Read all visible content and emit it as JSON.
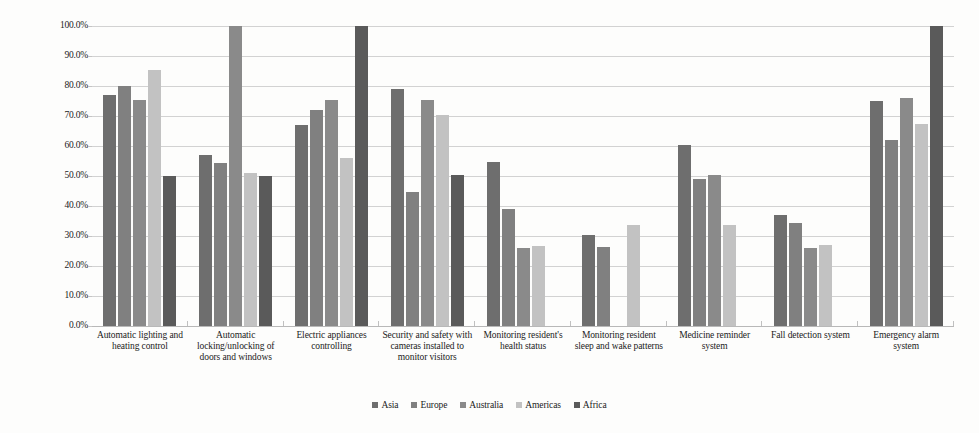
{
  "chart_data": {
    "type": "bar",
    "title": "",
    "subtitle": "",
    "xlabel": "",
    "ylabel": "",
    "ylim": [
      0,
      1.0
    ],
    "grid": true,
    "legend_position": "bottom",
    "y_tick_labels": [
      "100.0%",
      "90.0%",
      "80.0%",
      "70.0%",
      "60.0%",
      "50.0%",
      "40.0%",
      "30.0%",
      "20.0%",
      "10.0%",
      "0.0%"
    ],
    "y_tick_values": [
      1.0,
      0.9,
      0.8,
      0.7,
      0.6,
      0.5,
      0.4,
      0.3,
      0.2,
      0.1,
      0.0
    ],
    "value_format": "percent",
    "categories": [
      "Automatic lighting and heating control",
      "Automatic locking/unlocking of doors and windows",
      "Electric appliances controlling",
      "Security and safety with cameras installed to monitor visitors",
      "Monitoring resident's health status",
      "Monitoring resident sleep and wake patterns",
      "Medicine reminder system",
      "Fall detection system",
      "Emergency alarm system"
    ],
    "series": [
      {
        "name": "Asia",
        "color": "#6e6e6e",
        "values": [
          0.77,
          0.57,
          0.67,
          0.79,
          0.548,
          0.305,
          0.605,
          0.37,
          0.75
        ]
      },
      {
        "name": "Europe",
        "color": "#808080",
        "values": [
          0.8,
          0.542,
          0.72,
          0.448,
          0.39,
          0.262,
          0.49,
          0.345,
          0.62
        ]
      },
      {
        "name": "Australia",
        "color": "#8a8a8a",
        "values": [
          0.752,
          1.0,
          0.755,
          0.755,
          0.26,
          null,
          0.505,
          0.26,
          0.76
        ]
      },
      {
        "name": "Americas",
        "color": "#c2c2c2",
        "values": [
          0.852,
          0.51,
          0.56,
          0.705,
          0.268,
          0.338,
          0.338,
          0.27,
          0.675
        ]
      },
      {
        "name": "Africa",
        "color": "#5a5a5a",
        "values": [
          0.5,
          0.5,
          1.0,
          0.505,
          null,
          null,
          null,
          null,
          1.0
        ]
      }
    ]
  }
}
